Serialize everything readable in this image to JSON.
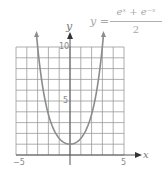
{
  "chart_data": {
    "type": "line",
    "equation": {
      "lhs": "y =",
      "numerator": "eˣ + e⁻ˣ",
      "denominator": "2"
    },
    "xlabel": "x",
    "ylabel": "y",
    "xlim": [
      -5,
      5
    ],
    "ylim": [
      0,
      10
    ],
    "grid": true,
    "x_ticks": [
      {
        "value": -5,
        "label": "−5"
      },
      {
        "value": 5,
        "label": "5"
      }
    ],
    "y_ticks": [
      {
        "value": 5,
        "label": "5"
      },
      {
        "value": 10,
        "label": "10"
      }
    ],
    "series": [
      {
        "name": "cosh(x)",
        "x": [
          -3.1,
          -3,
          -2.5,
          -2,
          -1.5,
          -1,
          -0.5,
          0,
          0.5,
          1,
          1.5,
          2,
          2.5,
          3,
          3.1
        ],
        "values": [
          11.1,
          10.07,
          6.13,
          3.76,
          2.35,
          1.54,
          1.13,
          1,
          1.13,
          1.54,
          2.35,
          3.76,
          6.13,
          10.07,
          11.1
        ]
      }
    ],
    "colors": {
      "grid": "#8a8a8a",
      "axis": "#555555",
      "curve": "#8c8c8c",
      "text": "#9a9a9a"
    }
  }
}
